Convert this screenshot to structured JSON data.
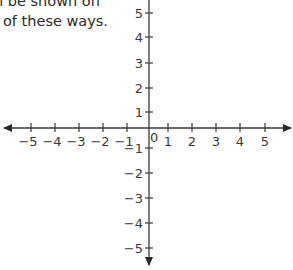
{
  "caption": {
    "line1": "n be shown on",
    "line2": "of these ways."
  },
  "plane": {
    "origin": {
      "x": 149,
      "y": 128
    },
    "origin_label": "0",
    "x_axis": {
      "left_end": 4,
      "right_end": 291,
      "ticks": [
        {
          "value": -5,
          "label": "−5",
          "x": 31
        },
        {
          "value": -4,
          "label": "−4",
          "x": 55
        },
        {
          "value": -3,
          "label": "−3",
          "x": 79
        },
        {
          "value": -2,
          "label": "−2",
          "x": 103
        },
        {
          "value": -1,
          "label": "−1",
          "x": 127
        },
        {
          "value": 1,
          "label": "1",
          "x": 168
        },
        {
          "value": 2,
          "label": "2",
          "x": 192
        },
        {
          "value": 3,
          "label": "3",
          "x": 216
        },
        {
          "value": 4,
          "label": "4",
          "x": 240
        },
        {
          "value": 5,
          "label": "5",
          "x": 265
        }
      ]
    },
    "y_axis": {
      "top_end": -2,
      "bottom_end": 265,
      "ticks": [
        {
          "value": 5,
          "label": "5",
          "y": 13
        },
        {
          "value": 4,
          "label": "4",
          "y": 37
        },
        {
          "value": 3,
          "label": "3",
          "y": 63
        },
        {
          "value": 2,
          "label": "2",
          "y": 88
        },
        {
          "value": 1,
          "label": "1",
          "y": 112
        },
        {
          "value": -1,
          "label": "−1",
          "y": 148
        },
        {
          "value": -2,
          "label": "−2",
          "y": 173
        },
        {
          "value": -3,
          "label": "−3",
          "y": 198
        },
        {
          "value": -4,
          "label": "−4",
          "y": 223
        },
        {
          "value": -5,
          "label": "−5",
          "y": 248
        }
      ]
    },
    "colors": {
      "axis": "#3a3a3a",
      "text": "#2a2a2a",
      "background": "#ffffff"
    }
  }
}
